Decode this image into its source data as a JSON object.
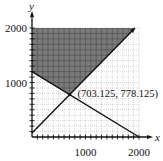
{
  "chart_data": {
    "type": "line",
    "title": "",
    "xlabel": "x",
    "ylabel": "y",
    "xlim": [
      0,
      2000
    ],
    "ylim": [
      0,
      2000
    ],
    "grid": true,
    "grid_step": 100,
    "x_ticks": [
      {
        "value": 1000,
        "label": "1000"
      },
      {
        "value": 2000,
        "label": "2000"
      }
    ],
    "y_ticks": [
      {
        "value": 1000,
        "label": "1000"
      },
      {
        "value": 2000,
        "label": "2000"
      }
    ],
    "series": [
      {
        "name": "line-decreasing",
        "equation": "y = 1200 - 0.6x",
        "points": [
          [
            0,
            1200
          ],
          [
            2000,
            0
          ]
        ]
      },
      {
        "name": "line-increasing",
        "equation": "y = x + 75",
        "points": [
          [
            0,
            75
          ],
          [
            1925,
            2000
          ]
        ],
        "arrow": true
      }
    ],
    "shaded_region": {
      "description": "y >= x + 75 and y >= 1200 - 0.6x, y <= 2000",
      "vertices": [
        [
          0,
          2000
        ],
        [
          0,
          1200
        ],
        [
          703.125,
          778.125
        ],
        [
          1925,
          2000
        ]
      ],
      "color": "#7a7a7a"
    },
    "annotations": [
      {
        "text": "(703.125, 778.125)",
        "x": 703.125,
        "y": 778.125
      }
    ]
  }
}
